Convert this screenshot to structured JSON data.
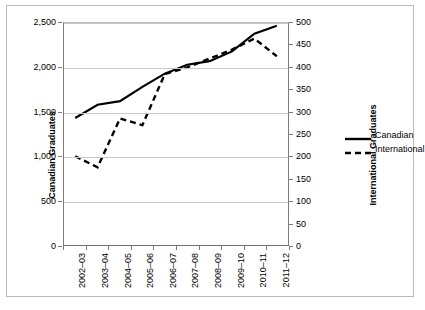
{
  "chart_data": {
    "type": "line",
    "title": "",
    "subtitle": "",
    "xlabel": "",
    "ylabel": "Canadian Graduates",
    "y2label": "International Graduates",
    "grid": true,
    "legend_position": "right",
    "categories": [
      "2002–03",
      "2003–04",
      "2004–05",
      "2005–06",
      "2006–07",
      "2007–08",
      "2008–09",
      "2009–10",
      "2010–11",
      "2011–12"
    ],
    "ylim": [
      0,
      2500
    ],
    "y2lim": [
      0,
      500
    ],
    "yticks": [
      "0",
      "500",
      "1,000",
      "1,500",
      "2,000",
      "2,500"
    ],
    "ytick_values": [
      0,
      500,
      1000,
      1500,
      2000,
      2500
    ],
    "y2ticks": [
      "0",
      "50",
      "100",
      "150",
      "200",
      "250",
      "300",
      "350",
      "400",
      "450",
      "500"
    ],
    "y2tick_values": [
      0,
      50,
      100,
      150,
      200,
      250,
      300,
      350,
      400,
      450,
      500
    ],
    "gridline_values": [
      500,
      1000,
      1500,
      2000,
      2500
    ],
    "series": [
      {
        "name": "Canadian",
        "axis": "left",
        "style": "solid",
        "color": "#000000",
        "values": [
          1430,
          1580,
          1620,
          1780,
          1930,
          2030,
          2070,
          2180,
          2380,
          2470
        ]
      },
      {
        "name": "International",
        "axis": "right",
        "style": "dashed",
        "color": "#000000",
        "values": [
          200,
          175,
          285,
          270,
          385,
          400,
          420,
          440,
          465,
          425
        ]
      }
    ]
  },
  "legend": {
    "items": [
      {
        "label": "Canadian",
        "style": "solid"
      },
      {
        "label": "International",
        "style": "dashed"
      }
    ]
  },
  "colors": {
    "line": "#000000",
    "gridline": "#c9c9c9",
    "axis": "#7c7c7c",
    "frame": "#b9b9b9",
    "background": "#ffffff"
  }
}
